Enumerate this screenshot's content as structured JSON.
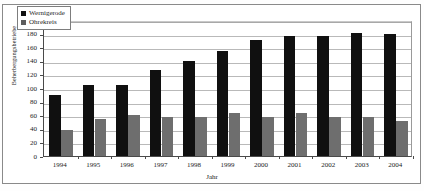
{
  "chart_data": {
    "type": "bar",
    "title": "",
    "subtitle": "",
    "xlabel": "Jahr",
    "ylabel": "Beherbergungsbetriebe",
    "categories": [
      "1994",
      "1995",
      "1996",
      "1997",
      "1998",
      "1999",
      "2000",
      "2001",
      "2002",
      "2003",
      "2004"
    ],
    "series": [
      {
        "name": "Wernigerode",
        "color": "#101010",
        "values": [
          90,
          105,
          105,
          127,
          140,
          155,
          170,
          177,
          176,
          181,
          180
        ]
      },
      {
        "name": "Ohrekreis",
        "color": "#6e6e6e",
        "values": [
          38,
          55,
          60,
          57,
          58,
          63,
          58,
          63,
          57,
          57,
          52
        ]
      }
    ],
    "ylim": [
      0,
      200
    ],
    "ytick_step": 20,
    "yticks": [
      "0",
      "20",
      "40",
      "60",
      "80",
      "100",
      "120",
      "140",
      "160",
      "180",
      "200"
    ],
    "grid": true,
    "legend_position": "top-left-inside",
    "annotations": []
  },
  "legend": {
    "entries": [
      {
        "label": "Wernigerode"
      },
      {
        "label": "Ohrekreis"
      }
    ]
  }
}
